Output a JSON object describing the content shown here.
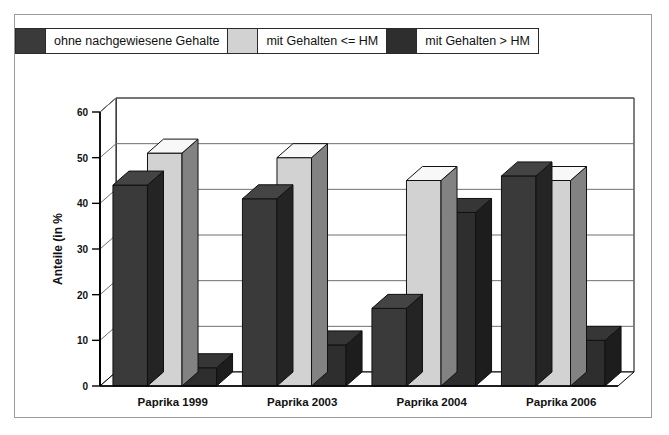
{
  "chart_data": {
    "type": "bar",
    "title": "",
    "subtitle": "",
    "xlabel": "",
    "ylabel": "Anteile (in %",
    "categories": [
      "Paprika 1999",
      "Paprika 2003",
      "Paprika 2004",
      "Paprika 2006"
    ],
    "series": [
      {
        "name": "ohne nachgewiesene Gehalte",
        "color": "#3a3a3a",
        "values": [
          44,
          41,
          17,
          46
        ]
      },
      {
        "name": "mit Gehalten <= HM",
        "color": "#d2d2d2",
        "values": [
          51,
          50,
          45,
          45
        ]
      },
      {
        "name": "mit Gehalten > HM",
        "color": "#2e2e2e",
        "values": [
          4,
          9,
          38,
          10
        ]
      }
    ],
    "ylim": [
      0,
      60
    ],
    "yticks": [
      0,
      10,
      20,
      30,
      40,
      50,
      60
    ],
    "ytick_labels": [
      "0",
      "10",
      "20",
      "30",
      "40",
      "50",
      "60"
    ],
    "grid": true,
    "grid_axis": "y",
    "legend_position": "top-left",
    "style": "3d-column"
  },
  "legend": {
    "entries": [
      {
        "label": "ohne nachgewiesene Gehalte",
        "swatch": "dark-gray-swatch"
      },
      {
        "label": "mit Gehalten <= HM",
        "swatch": "light-gray-swatch"
      },
      {
        "label": "mit Gehalten > HM",
        "swatch": "black-swatch"
      }
    ]
  },
  "colors": {
    "series_1": "#3a3a3a",
    "series_2": "#d2d2d2",
    "series_3": "#2e2e2e",
    "axis": "#000000",
    "grid": "#6f6f6f",
    "frame": "#9a9a9a",
    "background": "#ffffff"
  }
}
